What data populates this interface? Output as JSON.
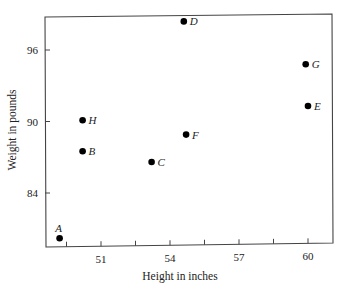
{
  "chart_data": {
    "type": "scatter",
    "title": "",
    "xlabel": "Height in inches",
    "ylabel": "Weight in pounds",
    "xlim": [
      48.5,
      61
    ],
    "ylim": [
      79.5,
      99
    ],
    "x_ticks": [
      51,
      54,
      57,
      60
    ],
    "x_minor_ticks": [
      49.5,
      52.5,
      55.5,
      58.5
    ],
    "y_ticks": [
      84,
      90,
      96
    ],
    "grid": false,
    "legend": null,
    "points": [
      {
        "label": "A",
        "x": 49.2,
        "y": 80.2,
        "label_pos": "above"
      },
      {
        "label": "B",
        "x": 50.2,
        "y": 87.5,
        "label_pos": "right"
      },
      {
        "label": "C",
        "x": 53.2,
        "y": 86.6,
        "label_pos": "right"
      },
      {
        "label": "D",
        "x": 54.6,
        "y": 98.4,
        "label_pos": "right"
      },
      {
        "label": "E",
        "x": 60.0,
        "y": 91.3,
        "label_pos": "right"
      },
      {
        "label": "F",
        "x": 54.7,
        "y": 88.9,
        "label_pos": "right"
      },
      {
        "label": "G",
        "x": 59.9,
        "y": 94.8,
        "label_pos": "right"
      },
      {
        "label": "H",
        "x": 50.2,
        "y": 90.1,
        "label_pos": "right"
      }
    ]
  },
  "colors": {
    "axis": "#444444",
    "point": "#000000",
    "text": "#222222"
  }
}
